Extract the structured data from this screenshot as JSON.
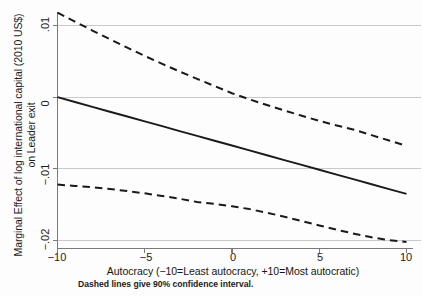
{
  "chart_data": {
    "type": "line",
    "title": "",
    "subtitle": "",
    "xlabel": "Autocracy (−10=Least autocracy, +10=Most autocratic)",
    "ylabel": "Marginal Effect of log international capital (2010 US$) on Leader exit",
    "ylabel_lines": [
      "Marginal Effect of log international capital (2010 US$)",
      "on Leader exit"
    ],
    "note": "Dashed lines give 90% confidence interval.",
    "xlim": [
      -10,
      10
    ],
    "ylim": [
      -0.0205,
      0.0125
    ],
    "xticks": [
      -10,
      -5,
      0,
      5,
      10
    ],
    "xticklabels": [
      "−10",
      "−5",
      "0",
      "5",
      "10"
    ],
    "yticks": [
      0.01,
      0,
      -0.01,
      -0.02
    ],
    "yticklabels": [
      ".01",
      "0",
      "−.01",
      "−.02"
    ],
    "grid": "horizontal",
    "legend": "none",
    "x": [
      -10,
      -9,
      -8,
      -7,
      -6,
      -5,
      -4,
      -3,
      -2,
      -1,
      0,
      1,
      2,
      3,
      4,
      5,
      6,
      7,
      8,
      9,
      10
    ],
    "series": [
      {
        "name": "Marginal effect",
        "style": "solid",
        "color": "#1a1a1a",
        "values": [
          0.0,
          -0.00068,
          -0.00135,
          -0.00203,
          -0.0027,
          -0.00338,
          -0.00405,
          -0.00473,
          -0.0054,
          -0.00608,
          -0.00675,
          -0.00743,
          -0.0081,
          -0.00878,
          -0.00945,
          -0.01013,
          -0.0108,
          -0.01148,
          -0.01215,
          -0.01283,
          -0.0135
        ]
      },
      {
        "name": "Upper 90% confidence bound",
        "style": "dashed",
        "color": "#1a1a1a",
        "values": [
          0.0118,
          0.01055,
          0.0093,
          0.0081,
          0.0069,
          0.00575,
          0.00465,
          0.00358,
          0.00255,
          0.00155,
          0.00055,
          -0.0003,
          -0.0011,
          -0.00185,
          -0.0026,
          -0.0033,
          -0.00395,
          -0.00455,
          -0.0053,
          -0.00605,
          -0.0068
        ]
      },
      {
        "name": "Lower 90% confidence bound",
        "style": "dashed",
        "color": "#1a1a1a",
        "values": [
          -0.0122,
          -0.01238,
          -0.01258,
          -0.01282,
          -0.0131,
          -0.01342,
          -0.01378,
          -0.01418,
          -0.01462,
          -0.0149,
          -0.01522,
          -0.01562,
          -0.01612,
          -0.01668,
          -0.01728,
          -0.0179,
          -0.0185,
          -0.01905,
          -0.01955,
          -0.01995,
          -0.0202
        ]
      }
    ]
  },
  "axes": {
    "x_title": "Autocracy (−10=Least autocracy, +10=Most autocratic)",
    "y_title_line1": "Marginal Effect of log international capital (2010 US$)",
    "y_title_line2": "on Leader exit",
    "x_tick_labels": [
      "−10",
      "−5",
      "0",
      "5",
      "10"
    ],
    "y_tick_labels": [
      ".01",
      "0",
      "−.01",
      "−.02"
    ]
  },
  "footnote": {
    "text": "Dashed lines give 90% confidence interval."
  },
  "style": {
    "grid_color": "#c9c9c9",
    "axis_color": "#7a7a7a",
    "line_color": "#1a1a1a",
    "background": "#fdfdfd"
  }
}
